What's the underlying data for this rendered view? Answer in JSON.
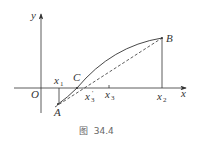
{
  "figure": {
    "caption": "图  34.4",
    "axes": {
      "x_label": "x",
      "y_label": "y",
      "origin_label": "O"
    },
    "points": {
      "A": "A",
      "B": "B",
      "C": "C"
    },
    "ticks": [
      {
        "base": "x",
        "sub": "1",
        "prime": ""
      },
      {
        "base": "x",
        "sub": "3",
        "prime": "'"
      },
      {
        "base": "x",
        "sub": "3",
        "prime": ""
      },
      {
        "base": "x",
        "sub": "2",
        "prime": ""
      }
    ],
    "colors": {
      "line": "#333333",
      "caption": "#666666"
    }
  }
}
